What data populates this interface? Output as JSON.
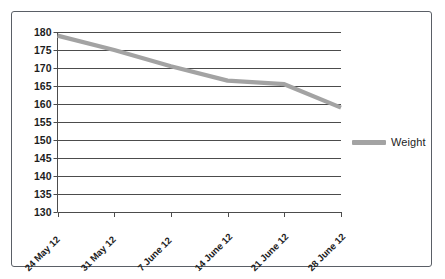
{
  "chart_data": {
    "type": "line",
    "title": "",
    "xlabel": "",
    "ylabel": "",
    "categories": [
      "24 May 12",
      "31 May 12",
      "7 June 12",
      "14 June 12",
      "21 June 12",
      "28 June 12"
    ],
    "series": [
      {
        "name": "Weight",
        "values": [
          179,
          175,
          170.5,
          166.5,
          165.5,
          159
        ],
        "color": "#a3a3a3"
      }
    ],
    "ylim": [
      130,
      180
    ],
    "ytick_step": 5,
    "ytick_labels": [
      "180",
      "175",
      "170",
      "165",
      "160",
      "155",
      "150",
      "145",
      "140",
      "135",
      "130"
    ],
    "grid": true,
    "grid_color": "#4c4c4c",
    "legend_position": "right",
    "legend_entries": [
      "Weight"
    ],
    "axis_color": "#4c4c4c",
    "background": "#ffffff"
  },
  "legend": {
    "weight_label": "Weight"
  },
  "icons": {
    "frame": "chart-border"
  }
}
